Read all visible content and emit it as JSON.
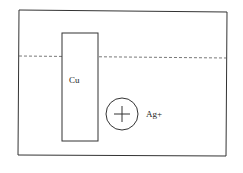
{
  "diagram": {
    "electrode": {
      "label": "Cu"
    },
    "ion": {
      "label": "Ag+",
      "symbol": "plus-in-circle"
    },
    "solution_level": {
      "style": "dashed"
    },
    "colors": {
      "stroke": "#333333",
      "dashed": "#555555",
      "background": "#ffffff"
    }
  }
}
